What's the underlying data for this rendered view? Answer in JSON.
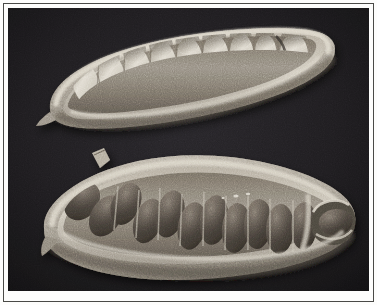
{
  "plate": {
    "medium": "black-and-white halftone photograph",
    "subject": "two cacao pods cut lengthwise showing seeds in the pulp cavity",
    "background_color": "#17161a",
    "frame_color": "#4a4a47",
    "paper_color": "#fdfdfc",
    "husk_light_color": "#cfc8ba",
    "husk_mid_color": "#9a9186",
    "husk_shadow_color": "#5c564e",
    "pale_seed_color": "#e3ded2",
    "dark_seed_color": "#4f4842",
    "figure_count": 2
  },
  "figures": [
    {
      "id": "upper-pod",
      "label": "Upper pod — longitudinal section, immature pale seeds",
      "orientation": "tilted, stalk end at right, tip at lower left",
      "seed_count": 9,
      "seed_tone": "pale",
      "seeds": [
        {
          "cx": 78,
          "cy": 76,
          "rx": 13,
          "ry": 22,
          "rot": -16,
          "tone": "pale"
        },
        {
          "cx": 104,
          "cy": 68,
          "rx": 13,
          "ry": 23,
          "rot": -13,
          "tone": "pale"
        },
        {
          "cx": 130,
          "cy": 62,
          "rx": 13,
          "ry": 24,
          "rot": -11,
          "tone": "pale"
        },
        {
          "cx": 156,
          "cy": 57,
          "rx": 13,
          "ry": 24,
          "rot": -9,
          "tone": "pale"
        },
        {
          "cx": 182,
          "cy": 53,
          "rx": 13,
          "ry": 24,
          "rot": -7,
          "tone": "pale"
        },
        {
          "cx": 208,
          "cy": 50,
          "rx": 13,
          "ry": 24,
          "rot": -5,
          "tone": "pale"
        },
        {
          "cx": 234,
          "cy": 48,
          "rx": 12,
          "ry": 23,
          "rot": -4,
          "tone": "pale"
        },
        {
          "cx": 258,
          "cy": 47,
          "rx": 11,
          "ry": 21,
          "rot": -3,
          "tone": "pale"
        },
        {
          "cx": 286,
          "cy": 46,
          "rx": 14,
          "ry": 20,
          "rot": -2,
          "tone": "pale"
        }
      ]
    },
    {
      "id": "lower-pod",
      "label": "Lower pod — longitudinal section, dark mature seeds",
      "orientation": "tilted, stalk stub at upper left, tip at lower left",
      "seed_count": 12,
      "seed_tone": "dark",
      "has_stalk_stub": true,
      "seeds": [
        {
          "cx": 74,
          "cy": 193,
          "rx": 16,
          "ry": 21,
          "rot": 38,
          "tone": "dark"
        },
        {
          "cx": 98,
          "cy": 208,
          "rx": 15,
          "ry": 22,
          "rot": 30,
          "tone": "dark"
        },
        {
          "cx": 118,
          "cy": 196,
          "rx": 14,
          "ry": 22,
          "rot": 24,
          "tone": "dark"
        },
        {
          "cx": 140,
          "cy": 213,
          "rx": 14,
          "ry": 23,
          "rot": 19,
          "tone": "dark"
        },
        {
          "cx": 162,
          "cy": 206,
          "rx": 14,
          "ry": 24,
          "rot": 14,
          "tone": "dark"
        },
        {
          "cx": 184,
          "cy": 218,
          "rx": 14,
          "ry": 24,
          "rot": 11,
          "tone": "dark"
        },
        {
          "cx": 206,
          "cy": 212,
          "rx": 14,
          "ry": 25,
          "rot": 8,
          "tone": "dark"
        },
        {
          "cx": 228,
          "cy": 220,
          "rx": 14,
          "ry": 25,
          "rot": 6,
          "tone": "dark"
        },
        {
          "cx": 250,
          "cy": 216,
          "rx": 14,
          "ry": 25,
          "rot": 4,
          "tone": "dark"
        },
        {
          "cx": 272,
          "cy": 221,
          "rx": 14,
          "ry": 25,
          "rot": 3,
          "tone": "dark"
        },
        {
          "cx": 296,
          "cy": 218,
          "rx": 13,
          "ry": 24,
          "rot": 2,
          "tone": "dark"
        },
        {
          "cx": 334,
          "cy": 224,
          "rx": 18,
          "ry": 17,
          "rot": -8,
          "tone": "dark"
        }
      ]
    }
  ],
  "annotations": {
    "caption": "",
    "plate_number": ""
  }
}
